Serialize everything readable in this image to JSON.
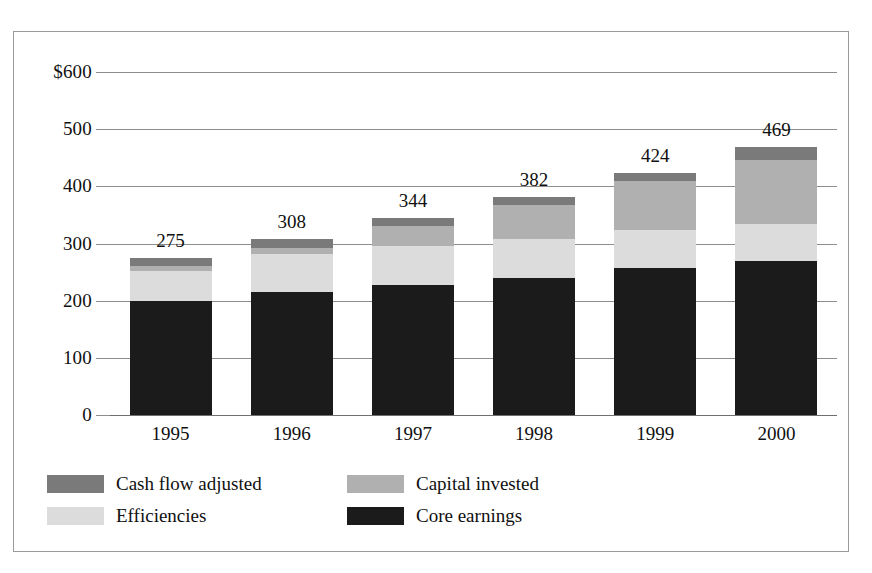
{
  "chart_data": {
    "type": "bar",
    "subtype": "stacked-column",
    "title": "",
    "subtitle": "",
    "xlabel": "",
    "ylabel": "",
    "categories": [
      "1995",
      "1996",
      "1997",
      "1998",
      "1999",
      "2000"
    ],
    "ylim": [
      0,
      600
    ],
    "yticks": [
      0,
      100,
      200,
      300,
      400,
      500,
      600
    ],
    "ytick_labels": [
      "0",
      "100",
      "200",
      "300",
      "400",
      "500",
      "$600"
    ],
    "grid": true,
    "legend_position": "bottom-left",
    "stack_order_bottom_to_top": [
      "Core earnings",
      "Efficiencies",
      "Capital invested",
      "Cash flow adjusted"
    ],
    "series": [
      {
        "name": "Core earnings",
        "color": "#1b1b1b",
        "values": [
          200,
          215,
          228,
          240,
          257,
          270
        ]
      },
      {
        "name": "Efficiencies",
        "color": "#dcdcdc",
        "values": [
          52,
          67,
          67,
          68,
          66,
          64
        ]
      },
      {
        "name": "Capital invested",
        "color": "#b0b0b0",
        "values": [
          8,
          10,
          35,
          60,
          86,
          112
        ]
      },
      {
        "name": "Cash flow adjusted",
        "color": "#7a7a7a",
        "values": [
          15,
          16,
          14,
          14,
          15,
          23
        ]
      }
    ],
    "totals": [
      275,
      308,
      344,
      382,
      424,
      469
    ],
    "total_labels": [
      "275",
      "308",
      "344",
      "382",
      "424",
      "469"
    ]
  },
  "legend": {
    "items": [
      {
        "label": "Cash flow adjusted",
        "color": "#7a7a7a"
      },
      {
        "label": "Capital invested",
        "color": "#b0b0b0"
      },
      {
        "label": "Efficiencies",
        "color": "#dcdcdc"
      },
      {
        "label": "Core earnings",
        "color": "#1b1b1b"
      }
    ]
  },
  "style": {
    "border_color": "#9a9a9a",
    "gridline_color": "#8d8d8d",
    "text_color": "#101010",
    "background": "#ffffff"
  }
}
